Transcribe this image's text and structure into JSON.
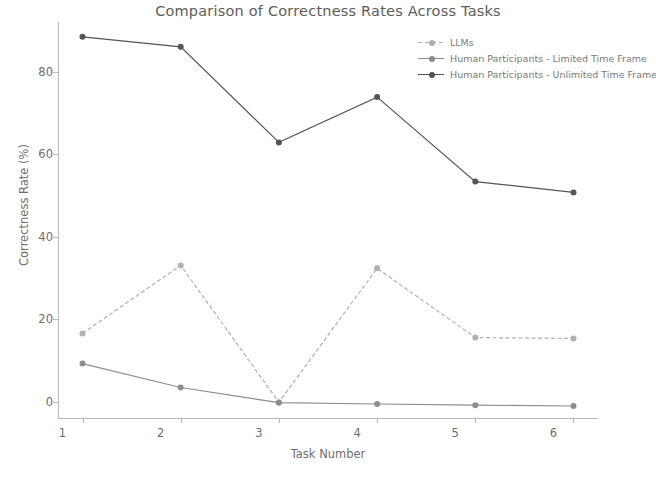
{
  "chart_data": {
    "type": "line",
    "title": "Comparison of Correctness Rates Across Tasks",
    "xlabel": "Task Number",
    "ylabel": "Correctness Rate (%)",
    "categories": [
      "1",
      "2",
      "3",
      "4",
      "5",
      "6"
    ],
    "x": [
      1,
      2,
      3,
      4,
      5,
      6
    ],
    "xlim": [
      0.75,
      6.25
    ],
    "ylim": [
      -4,
      92
    ],
    "xticks": [
      "1",
      "2",
      "3",
      "4",
      "5",
      "6"
    ],
    "yticks": [
      "0",
      "20",
      "40",
      "60",
      "80"
    ],
    "ytick_values": [
      0,
      20,
      40,
      60,
      80
    ],
    "grid": false,
    "legend_position": "upper right",
    "series": [
      {
        "name": "LLMs",
        "values": [
          16.5,
          33.0,
          -0.2,
          32.3,
          15.5,
          15.3
        ],
        "color": "#b0b0b0",
        "linestyle": "dashed",
        "marker": "circle"
      },
      {
        "name": "Human Participants - Limited Time Frame",
        "values": [
          9.2,
          3.4,
          -0.3,
          -0.6,
          -0.9,
          -1.1
        ],
        "color": "#8d8d8d",
        "linestyle": "solid",
        "marker": "circle"
      },
      {
        "name": "Human Participants - Unlimited Time Frame",
        "values": [
          88.4,
          86.0,
          62.8,
          73.8,
          53.3,
          50.7
        ],
        "color": "#555555",
        "linestyle": "solid",
        "marker": "circle"
      }
    ]
  },
  "legend": {
    "entries": [
      "LLMs",
      "Human Participants - Limited Time Frame",
      "Human Participants - Unlimited Time Frame"
    ]
  },
  "colors": {
    "llms": "#b0b0b0",
    "limited": "#8d8d8d",
    "unlimited": "#555555",
    "axis": "#b9b9b9",
    "text": "#6e6e6e",
    "background": "#ffffff"
  }
}
